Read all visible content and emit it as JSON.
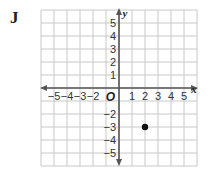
{
  "problem_label": "J",
  "chart_data": {
    "type": "scatter",
    "title": "",
    "xlabel": "x",
    "ylabel": "y",
    "origin_label": "O",
    "xlim": [
      -6,
      6
    ],
    "ylim": [
      -6,
      6
    ],
    "grid": true,
    "x_tick_labels": [
      "−5",
      "−4",
      "−3",
      "−2",
      "1",
      "2",
      "3",
      "4",
      "5"
    ],
    "y_tick_labels": [
      "5",
      "4",
      "3",
      "2",
      "1",
      "−2",
      "−3",
      "−4",
      "−5"
    ],
    "points": [
      {
        "x": 2,
        "y": -3
      }
    ]
  },
  "colors": {
    "grid": "#c8c8c8",
    "axis": "#555555",
    "point": "#111111"
  }
}
